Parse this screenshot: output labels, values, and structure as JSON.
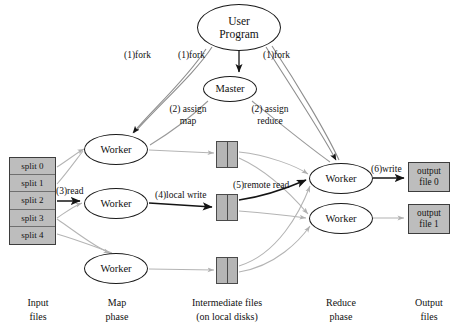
{
  "figure": {
    "background": "#ffffff",
    "stroke_dark": "#1a1a1a",
    "stroke_light": "#b0b0b0",
    "box_fill": "#bdbdbd"
  },
  "nodes": {
    "user_program": {
      "line1": "User",
      "line2": "Program"
    },
    "master": {
      "label": "Master"
    },
    "map_worker_1": {
      "label": "Worker"
    },
    "map_worker_2": {
      "label": "Worker"
    },
    "map_worker_3": {
      "label": "Worker"
    },
    "reduce_worker_1": {
      "label": "Worker"
    },
    "reduce_worker_2": {
      "label": "Worker"
    }
  },
  "input_splits": [
    {
      "label": "split 0"
    },
    {
      "label": "split 1"
    },
    {
      "label": "split 2"
    },
    {
      "label": "split 3"
    },
    {
      "label": "split 4"
    }
  ],
  "output_files": [
    {
      "line1": "output",
      "line2": "file 0"
    },
    {
      "line1": "output",
      "line2": "file 1"
    }
  ],
  "edge_labels": {
    "fork_left": "(1)fork",
    "fork_middle": "(1)fork",
    "fork_right": "(1)fork",
    "assign_map_num": "(2)",
    "assign_map_l1": "assign",
    "assign_map_l2": "map",
    "assign_reduce_num": "(2)",
    "assign_reduce_l1": "assign",
    "assign_reduce_l2": "reduce",
    "read": "(3)read",
    "local_write": "(4)local write",
    "remote_read": "(5)remote read",
    "write": "(6)write"
  },
  "column_captions": [
    {
      "line1": "Input",
      "line2": "files"
    },
    {
      "line1": "Map",
      "line2": "phase"
    },
    {
      "line1": "Intermediate files",
      "line2": "(on local disks)"
    },
    {
      "line1": "Reduce",
      "line2": "phase"
    },
    {
      "line1": "Output",
      "line2": "files"
    }
  ]
}
